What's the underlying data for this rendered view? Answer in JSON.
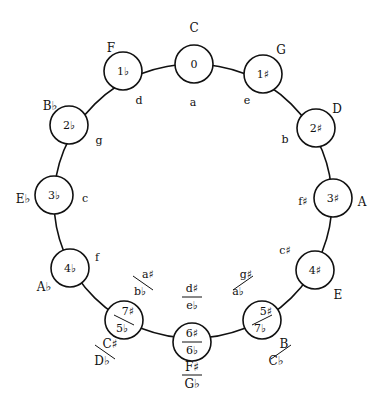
{
  "diagram": {
    "colors": {
      "stroke": "#111111",
      "background": "#ffffff"
    },
    "outer_ring": {
      "cx": 193,
      "cy": 201,
      "rx": 139,
      "ry": 137
    },
    "node_radius": 19,
    "nodes": [
      {
        "id": "n0",
        "x": 194,
        "y": 64,
        "signature": "0",
        "signature_alt": null,
        "major": "C",
        "major_alt": null,
        "major_pos": [
          194,
          28
        ],
        "minor": "a",
        "minor_alt": null,
        "minor_pos": [
          193,
          103
        ]
      },
      {
        "id": "n1s",
        "x": 263,
        "y": 74,
        "signature": "1♯",
        "signature_alt": null,
        "major": "G",
        "major_alt": null,
        "major_pos": [
          281,
          50
        ],
        "minor": "e",
        "minor_alt": null,
        "minor_pos": [
          247,
          101
        ]
      },
      {
        "id": "n2s",
        "x": 316,
        "y": 128,
        "signature": "2♯",
        "signature_alt": null,
        "major": "D",
        "major_alt": null,
        "major_pos": [
          337,
          109
        ],
        "minor": "b",
        "minor_alt": null,
        "minor_pos": [
          285,
          140
        ]
      },
      {
        "id": "n3s",
        "x": 333,
        "y": 198,
        "signature": "3♯",
        "signature_alt": null,
        "major": "A",
        "major_alt": null,
        "major_pos": [
          362,
          202
        ],
        "minor": "f♯",
        "minor_alt": null,
        "minor_pos": [
          303,
          202
        ]
      },
      {
        "id": "n4s",
        "x": 315,
        "y": 270,
        "signature": "4♯",
        "signature_alt": null,
        "major": "E",
        "major_alt": null,
        "major_pos": [
          338,
          295
        ],
        "minor": "c♯",
        "minor_alt": null,
        "minor_pos": [
          285,
          251
        ]
      },
      {
        "id": "n5s",
        "x": 262,
        "y": 320,
        "signature": "5♯",
        "signature_alt": "7♭",
        "major": "B",
        "major_alt": "C♭",
        "major_pos": [
          280,
          352
        ],
        "minor": "g♯",
        "minor_alt": "a♭",
        "minor_pos": [
          242,
          283
        ]
      },
      {
        "id": "n6",
        "x": 192,
        "y": 342,
        "signature": "6♯",
        "signature_alt": "6♭",
        "major": "F♯",
        "major_alt": "G♭",
        "major_pos": [
          192,
          375
        ],
        "minor": "d♯",
        "minor_alt": "e♭",
        "minor_pos": [
          192,
          297
        ]
      },
      {
        "id": "n7s",
        "x": 124,
        "y": 320,
        "signature": "7♯",
        "signature_alt": "5♭",
        "major": "C♯",
        "major_alt": "D♭",
        "major_pos": [
          106,
          352
        ],
        "minor": "a♯",
        "minor_alt": "b♭",
        "minor_pos": [
          144,
          283
        ]
      },
      {
        "id": "n4f",
        "x": 70,
        "y": 268,
        "signature": "4♭",
        "signature_alt": null,
        "major": "A♭",
        "major_alt": null,
        "major_pos": [
          44,
          287
        ],
        "minor": "f",
        "minor_alt": null,
        "minor_pos": [
          97,
          258
        ]
      },
      {
        "id": "n3f",
        "x": 54,
        "y": 195,
        "signature": "3♭",
        "signature_alt": null,
        "major": "E♭",
        "major_alt": null,
        "major_pos": [
          23,
          199
        ],
        "minor": "c",
        "minor_alt": null,
        "minor_pos": [
          85,
          199
        ]
      },
      {
        "id": "n2f",
        "x": 69,
        "y": 125,
        "signature": "2♭",
        "signature_alt": null,
        "major": "B♭",
        "major_alt": null,
        "major_pos": [
          50,
          106
        ],
        "minor": "g",
        "minor_alt": null,
        "minor_pos": [
          99,
          141
        ]
      },
      {
        "id": "n1f",
        "x": 123,
        "y": 71,
        "signature": "1♭",
        "signature_alt": null,
        "major": "F",
        "major_alt": null,
        "major_pos": [
          111,
          48
        ],
        "minor": "d",
        "minor_alt": null,
        "minor_pos": [
          139,
          101
        ]
      }
    ]
  }
}
